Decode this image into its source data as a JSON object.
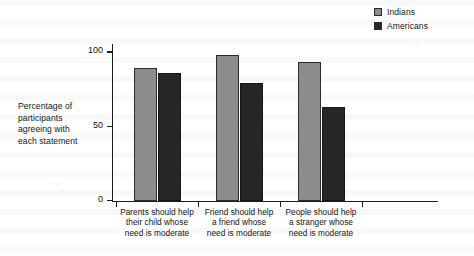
{
  "chart_data": {
    "type": "bar",
    "title": "",
    "subtitle": "",
    "xlabel": "",
    "ylabel": "Percentage of participants agreeing with each statement",
    "ylim": [
      0,
      100
    ],
    "yticks": [
      0,
      50,
      100
    ],
    "ytick_labels": [
      "0",
      "50",
      "100"
    ],
    "grid": false,
    "legend_position": "top-right",
    "categories": [
      "Parents should help their child whose need is moderate",
      "Friend should help a friend whose need is moderate",
      "People should help a stranger whose need is moderate"
    ],
    "category_lines": [
      [
        "Parents should help",
        "their child whose",
        "need is moderate"
      ],
      [
        "Friend should help",
        "a friend whose",
        "need is moderate"
      ],
      [
        "People should help",
        "a stranger whose",
        "need is moderate"
      ]
    ],
    "series": [
      {
        "name": "Indians",
        "color": "#8c8c8c",
        "values": [
          89,
          98,
          93
        ]
      },
      {
        "name": "Americans",
        "color": "#262626",
        "values": [
          86,
          79,
          63
        ]
      }
    ]
  },
  "legend": {
    "items": [
      {
        "label": "Indians",
        "color": "#8c8c8c"
      },
      {
        "label": "Americans",
        "color": "#262626"
      }
    ]
  },
  "axis": {
    "y_title_lines": [
      "Percentage of",
      "participants",
      "agreeing with",
      "each statement"
    ]
  }
}
